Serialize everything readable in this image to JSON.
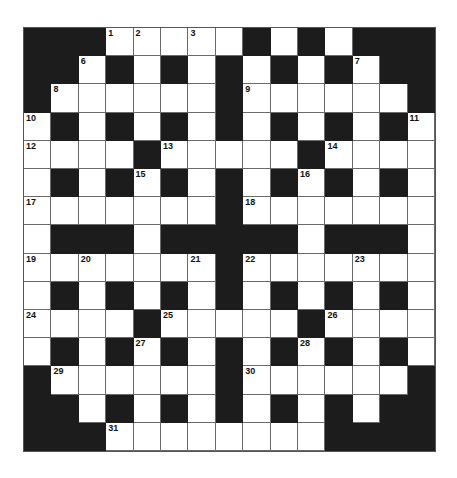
{
  "puzzle": {
    "rows": 15,
    "cols": 15,
    "colors": {
      "black": "#1c1c1c",
      "white": "#ffffff",
      "gridline": "#6a6a6a",
      "number": "#111111"
    },
    "layout": [
      "###.....#.#.###",
      "##.#.#.#.#.#.##",
      "#......#......#",
      ".#.#.#.#.#.#.#.",
      "....#.....#....",
      ".#.#.#.#.#.#.#.",
      ".......#.......",
      ".###.#####.###.",
      ".......#.......",
      ".#.#.#.#.#.#.#.",
      "....#.....#....",
      ".#.#.#.#.#.#.#.",
      "#......#......#",
      "##.#.#.#.#.#.##",
      "###........####"
    ],
    "numbers": [
      {
        "r": 0,
        "c": 3,
        "n": "1"
      },
      {
        "r": 0,
        "c": 4,
        "n": "2"
      },
      {
        "r": 0,
        "c": 6,
        "n": "3"
      },
      {
        "r": 0,
        "c": 8,
        "n": "4"
      },
      {
        "r": 0,
        "c": 10,
        "n": "5"
      },
      {
        "r": 1,
        "c": 2,
        "n": "6"
      },
      {
        "r": 1,
        "c": 12,
        "n": "7"
      },
      {
        "r": 2,
        "c": 1,
        "n": "8"
      },
      {
        "r": 2,
        "c": 8,
        "n": "9"
      },
      {
        "r": 3,
        "c": 0,
        "n": "10"
      },
      {
        "r": 3,
        "c": 14,
        "n": "11"
      },
      {
        "r": 4,
        "c": 0,
        "n": "12"
      },
      {
        "r": 4,
        "c": 5,
        "n": "13"
      },
      {
        "r": 4,
        "c": 11,
        "n": "14"
      },
      {
        "r": 5,
        "c": 4,
        "n": "15"
      },
      {
        "r": 5,
        "c": 10,
        "n": "16"
      },
      {
        "r": 6,
        "c": 0,
        "n": "17"
      },
      {
        "r": 6,
        "c": 8,
        "n": "18"
      },
      {
        "r": 8,
        "c": 0,
        "n": "19"
      },
      {
        "r": 8,
        "c": 2,
        "n": "20"
      },
      {
        "r": 8,
        "c": 6,
        "n": "21"
      },
      {
        "r": 8,
        "c": 8,
        "n": "22"
      },
      {
        "r": 8,
        "c": 12,
        "n": "23"
      },
      {
        "r": 10,
        "c": 0,
        "n": "24"
      },
      {
        "r": 10,
        "c": 5,
        "n": "25"
      },
      {
        "r": 10,
        "c": 11,
        "n": "26"
      },
      {
        "r": 11,
        "c": 4,
        "n": "27"
      },
      {
        "r": 11,
        "c": 10,
        "n": "28"
      },
      {
        "r": 12,
        "c": 1,
        "n": "29"
      },
      {
        "r": 12,
        "c": 8,
        "n": "30"
      },
      {
        "r": 14,
        "c": 3,
        "n": "31"
      }
    ]
  }
}
